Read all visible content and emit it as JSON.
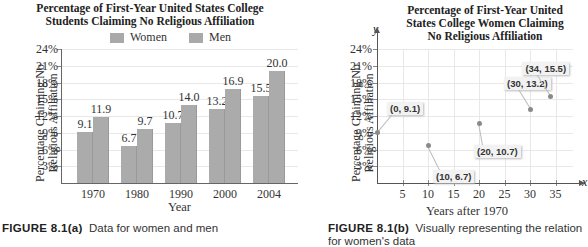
{
  "chart_data": [
    {
      "type": "bar",
      "title": "Percentage of First-Year United States College Students Claiming No Religious Affiliation",
      "title_lines": [
        "Percentage of First-Year United States College",
        "Students Claiming No Religious Affiliation"
      ],
      "xlabel": "Year",
      "ylabel": "Percentage Claiming No Religious Affiliation",
      "ylabel_lines": [
        "Percentage Claiming No",
        "Religious Affiliation"
      ],
      "categories": [
        "1970",
        "1980",
        "1990",
        "2000",
        "2004"
      ],
      "series": [
        {
          "name": "Women",
          "values": [
            9.1,
            6.7,
            10.7,
            13.2,
            15.5
          ],
          "color": "#ababab"
        },
        {
          "name": "Men",
          "values": [
            11.9,
            9.7,
            14.0,
            16.9,
            20.0
          ],
          "color": "#ababab"
        }
      ],
      "value_labels": {
        "Women": [
          "9.1",
          "6.7",
          "10.7",
          "13.2",
          "15.5"
        ],
        "Men": [
          "11.9",
          "9.7",
          "14.0",
          "16.9",
          "20.0"
        ]
      },
      "yticks": [
        "3%",
        "6%",
        "9%",
        "12%",
        "15%",
        "18%",
        "21%",
        "24%"
      ],
      "ylim": [
        0,
        24
      ],
      "grid": true,
      "legend_position": "top"
    },
    {
      "type": "scatter",
      "title": "Percentage of First-Year United States College Women Claiming No Religious Affiliation",
      "title_lines": [
        "Percentage of First-Year United",
        "States College Women Claiming",
        "No Religious Affiliation"
      ],
      "xlabel": "Years after 1970",
      "ylabel": "Percentage Claiming No Religious Affiliation",
      "ylabel_lines": [
        "Percentage Claiming No",
        "Religious Affiliation"
      ],
      "x_axis_var": "x",
      "y_axis_var": "y",
      "points": [
        {
          "x": 0,
          "y": 9.1,
          "label": "(0, 9.1)"
        },
        {
          "x": 10,
          "y": 6.7,
          "label": "(10, 6.7)"
        },
        {
          "x": 20,
          "y": 10.7,
          "label": "(20, 10.7)"
        },
        {
          "x": 30,
          "y": 13.2,
          "label": "(30, 13.2)"
        },
        {
          "x": 34,
          "y": 15.5,
          "label": "(34, 15.5)"
        }
      ],
      "xticks": [
        "5",
        "10",
        "15",
        "20",
        "25",
        "30",
        "35"
      ],
      "yticks": [
        "3%",
        "6%",
        "9%",
        "12%",
        "15%",
        "18%",
        "21%",
        "24%"
      ],
      "xlim": [
        0,
        40
      ],
      "ylim": [
        0,
        24
      ],
      "grid": true
    }
  ],
  "captions": {
    "a": {
      "figure": "FIGURE 8.1(a)",
      "text": "Data for women and men"
    },
    "b": {
      "figure": "FIGURE 8.1(b)",
      "text": "Visually representing the relation",
      "text_line2": "for women's data"
    }
  }
}
